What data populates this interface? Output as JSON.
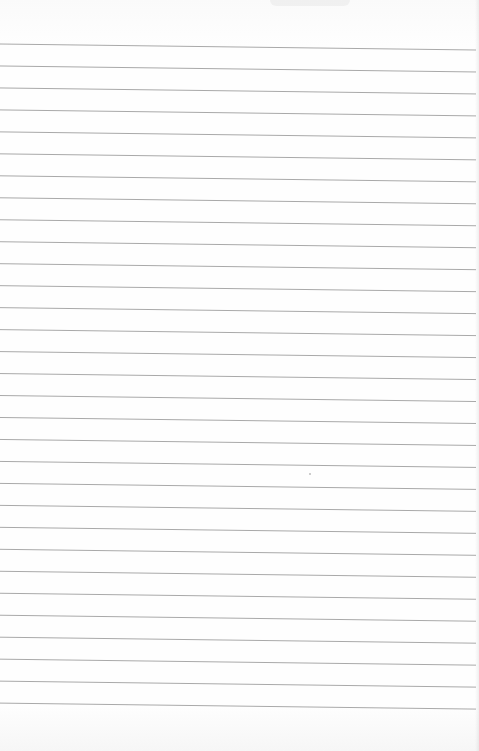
{
  "paper": {
    "type": "lined notebook page",
    "background_color": "#fdfdfd",
    "line_color": "#a9a9a9",
    "line_count": 31,
    "first_line_y_left": 44,
    "line_spacing_px": 21.97,
    "slope_px_across_width": 6,
    "handwritten_text": ""
  },
  "speck": {
    "x": 309,
    "y": 473
  }
}
